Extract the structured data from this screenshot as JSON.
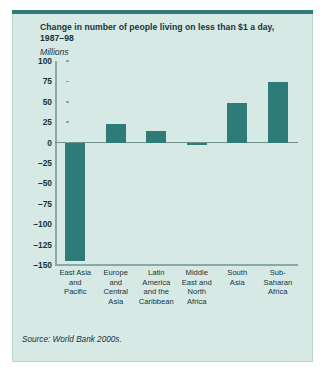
{
  "figure": {
    "title_lines": [
      "Change in number of people living on less than $1 a day,",
      "1987–98"
    ],
    "units_label": "Millions",
    "source": "Source: World Bank 2000s.",
    "colors": {
      "panel_background": "#d6e9e5",
      "panel_border": "#b9d6d1",
      "top_rule": "#2f7d79",
      "bar": "#2e7b78",
      "axis": "#8aa9a6",
      "zero_line": "#6f8f8c",
      "text": "#17343a"
    }
  },
  "chart_data": {
    "type": "bar",
    "title": "Change in number of people living on less than $1 a day, 1987–98",
    "subtitle": "",
    "xlabel": "",
    "ylabel": "Millions",
    "ylim": [
      -150,
      100
    ],
    "ytick_values": [
      100,
      75,
      50,
      25,
      0,
      -25,
      -50,
      -75,
      -100,
      -125,
      -150
    ],
    "ytick_labels": [
      "100",
      "75",
      "50",
      "25",
      "0",
      "–25",
      "–50",
      "–75",
      "–100",
      "–125",
      "–150"
    ],
    "grid": false,
    "legend": false,
    "zero_line": true,
    "categories": [
      "East Asia and Pacific",
      "Europe and Central Asia",
      "Latin America and the Caribbean",
      "Middle East and North Africa",
      "South Asia",
      "Sub-Saharan Africa"
    ],
    "category_label_lines": [
      [
        "East Asia",
        "and",
        "Pacific"
      ],
      [
        "Europe",
        "and",
        "Central",
        "Asia"
      ],
      [
        "Latin",
        "America",
        "and the",
        "Caribbean"
      ],
      [
        "Middle",
        "East and",
        "North",
        "Africa"
      ],
      [
        "South",
        "Asia"
      ],
      [
        "Sub-",
        "Saharan",
        "Africa"
      ]
    ],
    "values": [
      -145,
      23,
      14,
      -3,
      48,
      74
    ],
    "series": [
      {
        "name": "Change in number of people living on less than $1 a day, 1987–98",
        "values": [
          -145,
          23,
          14,
          -3,
          48,
          74
        ]
      }
    ]
  }
}
